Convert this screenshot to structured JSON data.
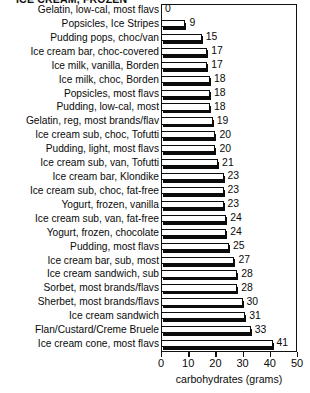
{
  "chart_data": {
    "type": "bar",
    "orientation": "horizontal",
    "title": "ICE CREAM, FROZEN",
    "xlabel": "carbohydrates (grams)",
    "ylabel": "",
    "xlim": [
      0,
      50
    ],
    "xticks": [
      0,
      10,
      20,
      30,
      40,
      50
    ],
    "grid": false,
    "legend": null,
    "categories": [
      "Gelatin, low-cal, most flavs",
      "Popsicles, Ice Stripes",
      "Pudding pops, choc/van",
      "Ice cream bar, choc-covered",
      "Ice milk, vanilla, Borden",
      "Ice milk, choc, Borden",
      "Popsicles, most flavs",
      "Pudding, low-cal, most",
      "Gelatin, reg, most brands/flav",
      "Ice cream sub, choc, Tofutti",
      "Pudding, light, most flavs",
      "Ice cream sub, van, Tofutti",
      "Ice cream bar, Klondike",
      "Ice cream sub, choc, fat-free",
      "Yogurt, frozen, vanilla",
      "Ice cream sub, van, fat-free",
      "Yogurt, frozen, chocolate",
      "Pudding, most flavs",
      "Ice cream bar, sub, most",
      "Ice cream sandwich, sub",
      "Sorbet, most brands/flavs",
      "Sherbet, most brands/flavs",
      "Ice cream sandwich",
      "Flan/Custard/Creme Bruele",
      "Ice cream cone, most flavs"
    ],
    "values": [
      0,
      9,
      15,
      17,
      17,
      18,
      18,
      18,
      19,
      20,
      20,
      21,
      23,
      23,
      23,
      24,
      24,
      25,
      27,
      28,
      28,
      30,
      31,
      33,
      41
    ],
    "value_labels": [
      "0",
      "9",
      "15",
      "17",
      "17",
      "18",
      "18",
      "18",
      "19",
      "20",
      "20",
      "21",
      "23",
      "23",
      "23",
      "24",
      "24",
      "25",
      "27",
      "28",
      "28",
      "30",
      "31",
      "33",
      "41"
    ]
  },
  "style": {
    "bar_fill": "#ffffff",
    "bar_outline": "#0b0b0b",
    "shadow": "#0b0b0b",
    "background": "#ffffff",
    "text": "#0a0a0a"
  }
}
